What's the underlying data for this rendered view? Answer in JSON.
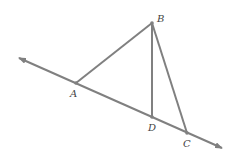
{
  "diagram": {
    "stroke_color": "#808080",
    "label_color": "#444444",
    "points": {
      "A": {
        "label": "A",
        "x": 76,
        "y": 83
      },
      "B": {
        "label": "B",
        "x": 152,
        "y": 23
      },
      "C": {
        "label": "C",
        "x": 187,
        "y": 133
      },
      "D": {
        "label": "D",
        "x": 152,
        "y": 117
      }
    },
    "line": {
      "from": [
        19,
        58
      ],
      "to": [
        222,
        148
      ],
      "arrows": "both"
    },
    "segments": [
      "AB",
      "BD",
      "BC"
    ]
  }
}
